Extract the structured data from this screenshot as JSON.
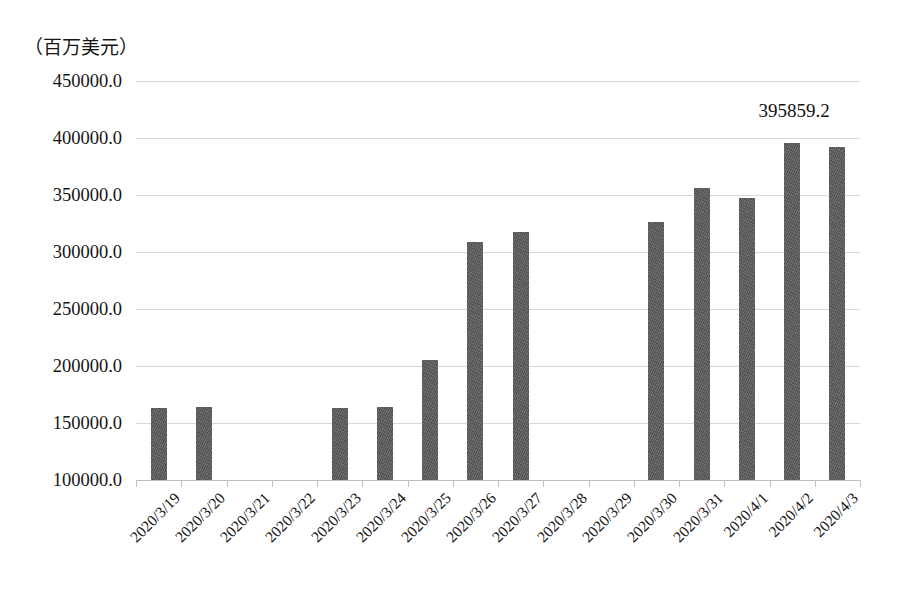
{
  "chart_data": {
    "type": "bar",
    "title": "（百万美元）",
    "xlabel": "",
    "ylabel": "（百万美元）",
    "ylim": [
      100000.0,
      450000.0
    ],
    "ytick_step": 50000.0,
    "ytick_labels": [
      "450000.0",
      "400000.0",
      "350000.0",
      "300000.0",
      "250000.0",
      "200000.0",
      "150000.0",
      "100000.0"
    ],
    "ytick_values": [
      450000.0,
      400000.0,
      350000.0,
      300000.0,
      250000.0,
      200000.0,
      150000.0,
      100000.0
    ],
    "grid": true,
    "legend": "none",
    "bar_color": "#585858",
    "categories": [
      "2020/3/19",
      "2020/3/20",
      "2020/3/21",
      "2020/3/22",
      "2020/3/23",
      "2020/3/24",
      "2020/3/25",
      "2020/3/26",
      "2020/3/27",
      "2020/3/28",
      "2020/3/29",
      "2020/3/30",
      "2020/3/31",
      "2020/4/1",
      "2020/4/2",
      "2020/4/3"
    ],
    "values": [
      163500.0,
      163800.0,
      null,
      null,
      163200.0,
      164000.0,
      205500.0,
      308500.0,
      317500.0,
      null,
      null,
      326500.0,
      356500.0,
      347500.0,
      395859.2,
      392500.0
    ],
    "annotations": [
      {
        "category": "2020/4/2",
        "text": "395859.2",
        "value": 395859.2
      }
    ]
  }
}
